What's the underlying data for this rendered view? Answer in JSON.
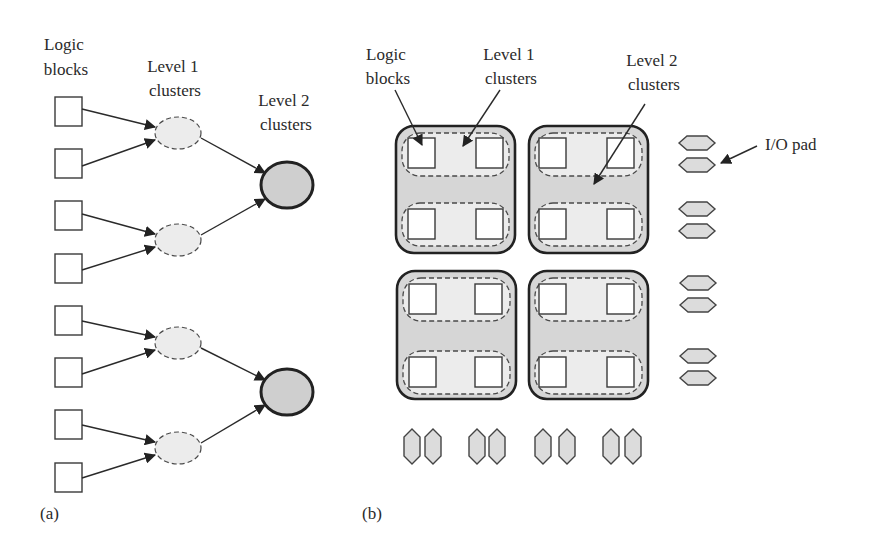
{
  "panel_a": {
    "caption": "(a)",
    "labels": {
      "logic_blocks": [
        "Logic",
        "blocks"
      ],
      "level1": [
        "Level 1",
        "clusters"
      ],
      "level2": [
        "Level 2",
        "clusters"
      ]
    },
    "logic_block_count": 8,
    "level1_cluster_count": 4,
    "level2_cluster_count": 2
  },
  "panel_b": {
    "caption": "(b)",
    "labels": {
      "logic_blocks": [
        "Logic",
        "blocks"
      ],
      "level1": [
        "Level 1",
        "clusters"
      ],
      "level2": [
        "Level 2",
        "clusters"
      ],
      "io_pad": "I/O pad"
    },
    "level2_tiles": 4,
    "level1_per_tile": 2,
    "blocks_per_level1": 2,
    "io_pads_right": 8,
    "io_pads_bottom": 8
  },
  "colors": {
    "stroke": "#222222",
    "level2_fill": "#cfcfcf",
    "level1_fill": "#ececec",
    "pad_fill": "#dcdcdc"
  }
}
